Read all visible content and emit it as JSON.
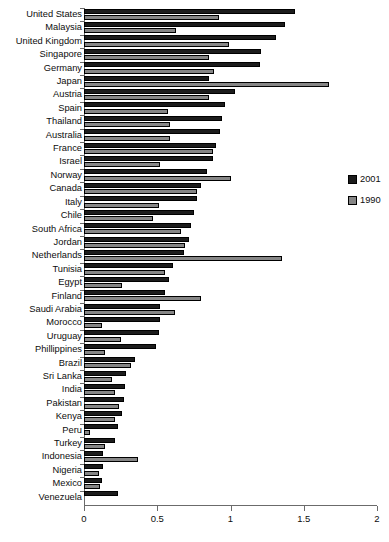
{
  "chart_data": {
    "type": "bar",
    "orientation": "horizontal",
    "title": "",
    "subtitle": "",
    "xlabel": "",
    "ylabel": "",
    "xlim": [
      0,
      2
    ],
    "xticks": [
      0,
      0.5,
      1,
      1.5,
      2
    ],
    "xtick_labels": [
      "0",
      "0.5",
      "1",
      "1.5",
      "2"
    ],
    "grid": false,
    "legend_position": "right",
    "categories": [
      "United States",
      "Malaysia",
      "United Kingdom",
      "Singapore",
      "Germany",
      "Japan",
      "Austria",
      "Spain",
      "Thailand",
      "Australia",
      "France",
      "Israel",
      "Norway",
      "Canada",
      "Italy",
      "Chile",
      "South Africa",
      "Jordan",
      "Netherlands",
      "Tunisia",
      "Egypt",
      "Finland",
      "Saudi Arabia",
      "Morocco",
      "Uruguay",
      "Phillippines",
      "Brazil",
      "Sri Lanka",
      "India",
      "Pakistan",
      "Kenya",
      "Peru",
      "Turkey",
      "Indonesia",
      "Nigeria",
      "Mexico",
      "Venezuela"
    ],
    "series": [
      {
        "name": "2001",
        "color": "#1c1c1c",
        "values": [
          1.44,
          1.37,
          1.31,
          1.21,
          1.2,
          0.85,
          1.03,
          0.96,
          0.94,
          0.93,
          0.9,
          0.88,
          0.84,
          0.8,
          0.77,
          0.75,
          0.73,
          0.72,
          0.68,
          0.61,
          0.58,
          0.55,
          0.52,
          0.52,
          0.51,
          0.49,
          0.35,
          0.29,
          0.28,
          0.27,
          0.26,
          0.23,
          0.21,
          0.13,
          0.13,
          0.12,
          0.23
        ]
      },
      {
        "name": "1990",
        "color": "#868686",
        "values": [
          0.92,
          0.63,
          0.99,
          0.85,
          0.89,
          1.67,
          0.85,
          0.57,
          0.59,
          0.59,
          0.88,
          0.52,
          1.0,
          0.77,
          0.51,
          0.47,
          0.66,
          0.69,
          1.35,
          0.55,
          0.26,
          0.8,
          0.62,
          0.12,
          0.25,
          0.14,
          0.32,
          0.19,
          0.21,
          0.24,
          0.21,
          0.04,
          0.14,
          0.37,
          0.1,
          0.11,
          0.0
        ]
      }
    ]
  },
  "legend": {
    "items": [
      {
        "label": "2001",
        "color": "#1c1c1c"
      },
      {
        "label": "1990",
        "color": "#868686"
      }
    ]
  },
  "axis": {
    "x_min_label": "0",
    "x_max_label": "2"
  }
}
